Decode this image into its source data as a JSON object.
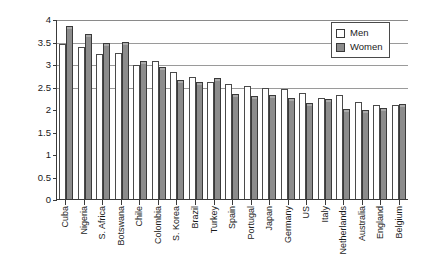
{
  "chart_data": {
    "type": "bar",
    "title": "",
    "xlabel": "",
    "ylabel": "Benevolent sexism",
    "ylim": [
      0,
      4
    ],
    "ytick_labels": [
      "0",
      "0.5",
      "1",
      "1.5",
      "2",
      "2.5",
      "3",
      "3.5",
      "4"
    ],
    "ytick_values": [
      0,
      0.5,
      1,
      1.5,
      2,
      2.5,
      3,
      3.5,
      4
    ],
    "gridlines": [
      2.5,
      3,
      3.5,
      4
    ],
    "grid": true,
    "legend_position": "top-right",
    "categories": [
      "Cuba",
      "Nigeria",
      "S. Africa",
      "Botswana",
      "Chile",
      "Colombia",
      "S. Korea",
      "Brazil",
      "Turkey",
      "Spain",
      "Portugal",
      "Japan",
      "Germany",
      "US",
      "Italy",
      "Netherlands",
      "Australia",
      "England",
      "Belgium"
    ],
    "series": [
      {
        "name": "Men",
        "color": "#ffffff",
        "values": [
          3.42,
          3.35,
          3.2,
          3.21,
          2.95,
          3.05,
          2.79,
          2.68,
          2.58,
          2.52,
          2.47,
          2.44,
          2.42,
          2.32,
          2.22,
          2.28,
          2.12,
          2.05,
          2.05
        ]
      },
      {
        "name": "Women",
        "color": "#8c8c8c",
        "values": [
          3.82,
          3.65,
          3.45,
          3.46,
          3.05,
          2.9,
          2.62,
          2.58,
          2.65,
          2.3,
          2.25,
          2.29,
          2.22,
          2.09,
          2.18,
          1.96,
          1.94,
          1.98,
          2.08
        ]
      }
    ]
  },
  "legend": {
    "items": [
      {
        "label": "Men",
        "swatch": "open-square"
      },
      {
        "label": "Women",
        "swatch": "filled-square"
      }
    ]
  }
}
